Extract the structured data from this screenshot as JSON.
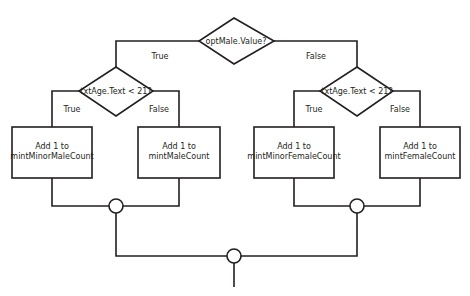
{
  "diagram": {
    "type": "flowchart",
    "decisions": {
      "top": {
        "text": "optMale.Value?"
      },
      "left": {
        "text": "txtAge.Text < 21?"
      },
      "right": {
        "text": "txtAge.Text < 21?"
      }
    },
    "branch_labels": {
      "top_true": "True",
      "top_false": "False",
      "left_true": "True",
      "left_false": "False",
      "right_true": "True",
      "right_false": "False"
    },
    "processes": [
      {
        "line1": "Add 1 to",
        "line2": "mintMinorMaleCount"
      },
      {
        "line1": "Add 1 to",
        "line2": "mintMaleCount"
      },
      {
        "line1": "Add 1 to",
        "line2": "mintMinorFemaleCount"
      },
      {
        "line1": "Add 1 to",
        "line2": "mintFemaleCount"
      }
    ],
    "colors": {
      "stroke": "#231f20",
      "background": "#ffffff"
    }
  }
}
